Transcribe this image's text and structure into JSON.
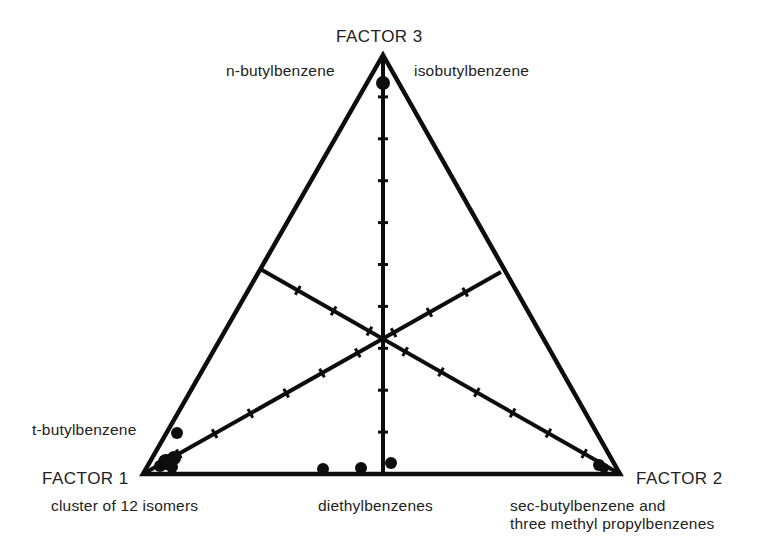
{
  "labels": {
    "factor3": "FACTOR 3",
    "factor1": "FACTOR 1",
    "factor2": "FACTOR 2",
    "top_left": "n-butylbenzene",
    "top_right": "isobutylbenzene",
    "left_upper": "t-butylbenzene",
    "left_lower": "cluster of 12 isomers",
    "bottom_center": "diethylbenzenes",
    "right_line1": "sec-butylbenzene and",
    "right_line2": "three methyl propylbenzenes"
  },
  "colors": {
    "ink": "#0d0d0d",
    "background": "#ffffff"
  },
  "geometry": {
    "vertices": {
      "top": [
        383,
        55
      ],
      "left": [
        143,
        474
      ],
      "right": [
        620,
        474
      ]
    },
    "centroid": [
      383,
      340
    ],
    "edge_midpoints": {
      "bottom": [
        383,
        474
      ],
      "left": [
        262,
        270
      ],
      "right": [
        501,
        272
      ]
    },
    "ticks_per_median": 10
  },
  "chart_data": {
    "type": "scatter",
    "subtype": "ternary",
    "title": "",
    "axes": [
      "FACTOR 1",
      "FACTOR 2",
      "FACTOR 3"
    ],
    "points": [
      {
        "label": "n-butylbenzene / isobutylbenzene",
        "x": 383,
        "y": 83,
        "r": 7
      },
      {
        "label": "t-butylbenzene",
        "x": 177,
        "y": 433,
        "r": 6
      },
      {
        "label": "cluster of 12 isomers",
        "x": 166,
        "y": 462,
        "r": 8
      },
      {
        "label": "cluster of 12 isomers",
        "x": 174,
        "y": 458,
        "r": 7
      },
      {
        "label": "cluster of 12 isomers",
        "x": 160,
        "y": 466,
        "r": 6
      },
      {
        "label": "cluster of 12 isomers",
        "x": 172,
        "y": 467,
        "r": 6
      },
      {
        "label": "diethylbenzenes",
        "x": 323,
        "y": 469,
        "r": 6
      },
      {
        "label": "diethylbenzenes",
        "x": 361,
        "y": 468,
        "r": 6
      },
      {
        "label": "diethylbenzenes",
        "x": 391,
        "y": 463,
        "r": 6
      },
      {
        "label": "sec-butylbenzene and three methyl propylbenzenes",
        "x": 599,
        "y": 465,
        "r": 6
      },
      {
        "label": "sec-butylbenzene and three methyl propylbenzenes",
        "x": 604,
        "y": 468,
        "r": 5
      }
    ],
    "grid": false,
    "legend": "none"
  }
}
